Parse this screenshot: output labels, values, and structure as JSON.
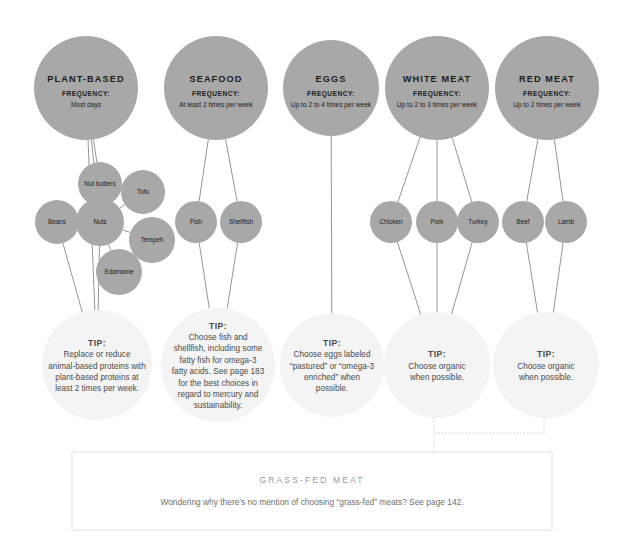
{
  "page": {
    "background_color": "#ffffff",
    "bubble_color": "#a8a8a8",
    "tip_bubble_color": "#f4f4f4",
    "line_color": "#8a8a8a",
    "dotted_color": "#cfcfcf",
    "box_border_color": "#e2e2e2"
  },
  "categories": [
    {
      "id": "plant-based",
      "title": "PLANT-BASED",
      "frequency_label": "FREQUENCY:",
      "frequency_value": "Most days",
      "cx": 86,
      "cy": 88,
      "r": 52
    },
    {
      "id": "seafood",
      "title": "SEAFOOD",
      "frequency_label": "FREQUENCY:",
      "frequency_value": "At least 2 times per week",
      "cx": 216,
      "cy": 88,
      "r": 52
    },
    {
      "id": "eggs",
      "title": "EGGS",
      "frequency_label": "FREQUENCY:",
      "frequency_value": "Up to 2 to 4 times per week",
      "cx": 331,
      "cy": 88,
      "r": 48
    },
    {
      "id": "white-meat",
      "title": "WHITE MEAT",
      "frequency_label": "FREQUENCY:",
      "frequency_value": "Up to 2 to 3 times per week",
      "cx": 437,
      "cy": 88,
      "r": 52
    },
    {
      "id": "red-meat",
      "title": "RED MEAT",
      "frequency_label": "FREQUENCY:",
      "frequency_value": "Up to 2 times per week",
      "cx": 547,
      "cy": 88,
      "r": 52
    }
  ],
  "foods": [
    {
      "id": "nut-butters",
      "label": "Nut butters",
      "cx": 100,
      "cy": 184,
      "r": 22,
      "parent": "plant-based"
    },
    {
      "id": "tofu",
      "label": "Tofu",
      "cx": 143,
      "cy": 192,
      "r": 22,
      "parent": "nuts"
    },
    {
      "id": "beans",
      "label": "Beans",
      "cx": 57,
      "cy": 222,
      "r": 22,
      "parent": "plant-based"
    },
    {
      "id": "nuts",
      "label": "Nuts",
      "cx": 100,
      "cy": 222,
      "r": 24,
      "parent": "plant-based"
    },
    {
      "id": "tempeh",
      "label": "Tempeh",
      "cx": 152,
      "cy": 240,
      "r": 23,
      "parent": "nuts"
    },
    {
      "id": "edamame",
      "label": "Edamame",
      "cx": 119,
      "cy": 272,
      "r": 23,
      "parent": "nuts"
    },
    {
      "id": "fish",
      "label": "Fish",
      "cx": 196,
      "cy": 222,
      "r": 21,
      "parent": "seafood"
    },
    {
      "id": "shellfish",
      "label": "Shellfish",
      "cx": 241,
      "cy": 222,
      "r": 21,
      "parent": "seafood"
    },
    {
      "id": "chicken",
      "label": "Chicken",
      "cx": 391,
      "cy": 222,
      "r": 21,
      "parent": "white-meat"
    },
    {
      "id": "pork",
      "label": "Pork",
      "cx": 437,
      "cy": 222,
      "r": 21,
      "parent": "white-meat"
    },
    {
      "id": "turkey",
      "label": "Turkey",
      "cx": 478,
      "cy": 222,
      "r": 21,
      "parent": "white-meat"
    },
    {
      "id": "beef",
      "label": "Beef",
      "cx": 523,
      "cy": 222,
      "r": 21,
      "parent": "red-meat"
    },
    {
      "id": "lamb",
      "label": "Lamb",
      "cx": 566,
      "cy": 222,
      "r": 21,
      "parent": "red-meat"
    }
  ],
  "tips": [
    {
      "id": "tip-plant-based",
      "head": "TIP:",
      "lines": [
        "Replace or reduce",
        "animal-based proteins with",
        "plant-based proteins at",
        "least 2 times per week."
      ],
      "cx": 97,
      "cy": 365,
      "r": 55
    },
    {
      "id": "tip-seafood",
      "head": "TIP:",
      "lines": [
        "Choose fish and",
        "shellfish, including some",
        "fatty fish for omega-3",
        "fatty acids. See page 183",
        "for the best choices in",
        "regard to mercury and",
        "sustainability."
      ],
      "cx": 218,
      "cy": 365,
      "r": 57
    },
    {
      "id": "tip-eggs",
      "head": "TIP:",
      "lines": [
        "Choose eggs labeled",
        "“pastured” or “omega-3",
        "enriched” when",
        "possible."
      ],
      "cx": 332,
      "cy": 365,
      "r": 52
    },
    {
      "id": "tip-white-meat",
      "head": "TIP:",
      "lines": [
        "Choose organic",
        "when possible."
      ],
      "cx": 437,
      "cy": 365,
      "r": 53
    },
    {
      "id": "tip-red-meat",
      "head": "TIP:",
      "lines": [
        "Choose organic",
        "when possible."
      ],
      "cx": 546,
      "cy": 365,
      "r": 53
    }
  ],
  "callout_box": {
    "title": "GRASS-FED MEAT",
    "body": "Wondering why there’s no mention of choosing “grass-fed” meats? See page 142.",
    "x": 72,
    "y": 452,
    "width": 480,
    "height": 78
  },
  "connectors": {
    "category_to_food": [
      {
        "from": "plant-based",
        "to": "nut-butters"
      },
      {
        "from": "plant-based",
        "to": "nuts"
      },
      {
        "from": "nuts",
        "to": "tofu"
      },
      {
        "from": "nuts",
        "to": "tempeh"
      },
      {
        "from": "nuts",
        "to": "edamame"
      },
      {
        "from": "seafood",
        "to": "fish"
      },
      {
        "from": "seafood",
        "to": "shellfish"
      },
      {
        "from": "white-meat",
        "to": "chicken"
      },
      {
        "from": "white-meat",
        "to": "pork"
      },
      {
        "from": "white-meat",
        "to": "turkey"
      },
      {
        "from": "red-meat",
        "to": "beef"
      },
      {
        "from": "red-meat",
        "to": "lamb"
      }
    ],
    "food_to_tip": [
      {
        "from": "beans",
        "to": "tip-plant-based"
      },
      {
        "from": "nuts",
        "to": "tip-plant-based"
      },
      {
        "from": "fish",
        "to": "tip-seafood"
      },
      {
        "from": "shellfish",
        "to": "tip-seafood"
      },
      {
        "from": "chicken",
        "to": "tip-white-meat"
      },
      {
        "from": "pork",
        "to": "tip-white-meat"
      },
      {
        "from": "turkey",
        "to": "tip-white-meat"
      },
      {
        "from": "beef",
        "to": "tip-red-meat"
      },
      {
        "from": "lamb",
        "to": "tip-red-meat"
      }
    ],
    "category_to_tip": [
      {
        "from": "plant-based",
        "to": "tip-plant-based"
      },
      {
        "from": "eggs",
        "to": "tip-eggs"
      }
    ],
    "dotted_bracket": {
      "left_x": 434,
      "right_x": 544,
      "bar_y": 433,
      "top_y": 417,
      "drop_y": 452
    }
  }
}
